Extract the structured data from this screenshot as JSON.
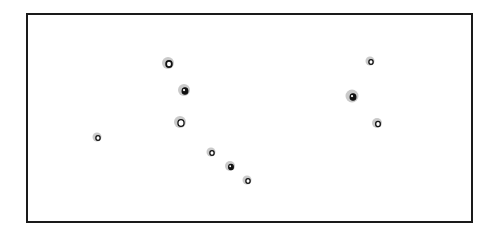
{
  "figure": {
    "frame": {
      "x": 26,
      "y": 13,
      "width": 445,
      "height": 208,
      "border_color": "#1a1a1a"
    },
    "colors": {
      "halo": "#bdbdbd",
      "ring": "#111111",
      "fill_light": "#ffffff",
      "fill_dark": "#111111"
    },
    "markers": [
      {
        "id": 1,
        "cx": 169,
        "cy": 64,
        "halo_r": 6,
        "ring_r": 3.2,
        "style": "ring-thick"
      },
      {
        "id": 2,
        "cx": 185,
        "cy": 91,
        "halo_r": 6,
        "ring_r": 3.2,
        "style": "filled"
      },
      {
        "id": 3,
        "cx": 181,
        "cy": 123,
        "halo_r": 6,
        "ring_r": 3.4,
        "style": "ring"
      },
      {
        "id": 4,
        "cx": 98,
        "cy": 138,
        "halo_r": 4.5,
        "ring_r": 2.4,
        "style": "ring"
      },
      {
        "id": 5,
        "cx": 212,
        "cy": 153,
        "halo_r": 4.5,
        "ring_r": 2.4,
        "style": "ring"
      },
      {
        "id": 6,
        "cx": 231,
        "cy": 167,
        "halo_r": 5,
        "ring_r": 2.6,
        "style": "filled"
      },
      {
        "id": 7,
        "cx": 248,
        "cy": 181,
        "halo_r": 4.5,
        "ring_r": 2.4,
        "style": "ring"
      },
      {
        "id": 8,
        "cx": 371,
        "cy": 62,
        "halo_r": 4.5,
        "ring_r": 2.4,
        "style": "ring"
      },
      {
        "id": 9,
        "cx": 353,
        "cy": 97,
        "halo_r": 6.5,
        "ring_r": 3.2,
        "style": "filled"
      },
      {
        "id": 10,
        "cx": 378,
        "cy": 124,
        "halo_r": 5,
        "ring_r": 2.6,
        "style": "ring"
      }
    ]
  }
}
